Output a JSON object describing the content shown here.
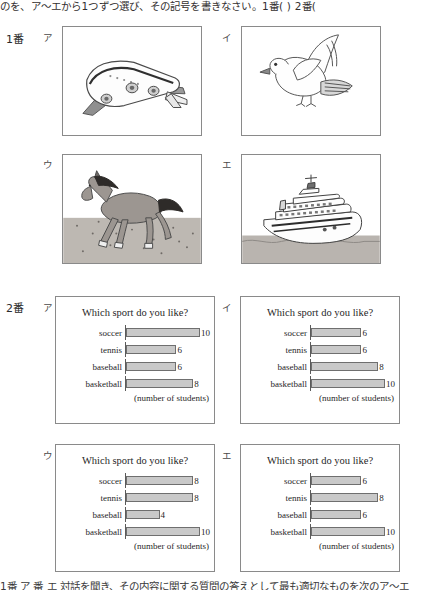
{
  "header": {
    "instruction": "のを、ア〜エから1つずつ選び、その記号を書きなさい。1番(        )  2番("
  },
  "footer": {
    "text": "1番 ア 番 エ 対話を聞き、その内容に関する質問の答えとして最も適切なものを次のア〜エ"
  },
  "question1": {
    "label": "1番",
    "choices": [
      {
        "letter": "ア",
        "picture": "airplane-illustration"
      },
      {
        "letter": "イ",
        "picture": "bird-illustration"
      },
      {
        "letter": "ウ",
        "picture": "horse-illustration"
      },
      {
        "letter": "エ",
        "picture": "ship-illustration"
      }
    ]
  },
  "question2": {
    "label": "2番",
    "choices": [
      {
        "letter": "ア",
        "chart_ref": 0
      },
      {
        "letter": "イ",
        "chart_ref": 1
      },
      {
        "letter": "ウ",
        "chart_ref": 2
      },
      {
        "letter": "エ",
        "chart_ref": 3
      }
    ]
  },
  "chart_data": [
    {
      "type": "bar",
      "orientation": "horizontal",
      "title": "Which sport do you like?",
      "categories": [
        "soccer",
        "tennis",
        "baseball",
        "basketball"
      ],
      "values": [
        10,
        6,
        6,
        8
      ],
      "xlabel": "(number of students)",
      "ylabel": "",
      "xlim": [
        0,
        10
      ],
      "grid": false,
      "legend": "none",
      "choice_letter": "ア"
    },
    {
      "type": "bar",
      "orientation": "horizontal",
      "title": "Which sport do you like?",
      "categories": [
        "soccer",
        "tennis",
        "baseball",
        "basketball"
      ],
      "values": [
        6,
        6,
        8,
        10
      ],
      "xlabel": "(number of students)",
      "ylabel": "",
      "xlim": [
        0,
        10
      ],
      "grid": false,
      "legend": "none",
      "choice_letter": "イ"
    },
    {
      "type": "bar",
      "orientation": "horizontal",
      "title": "Which sport do you like?",
      "categories": [
        "soccer",
        "tennis",
        "baseball",
        "basketball"
      ],
      "values": [
        8,
        8,
        4,
        10
      ],
      "xlabel": "(number of students)",
      "ylabel": "",
      "xlim": [
        0,
        10
      ],
      "grid": false,
      "legend": "none",
      "choice_letter": "ウ"
    },
    {
      "type": "bar",
      "orientation": "horizontal",
      "title": "Which sport do you like?",
      "categories": [
        "soccer",
        "tennis",
        "baseball",
        "basketball"
      ],
      "values": [
        6,
        8,
        6,
        10
      ],
      "xlabel": "(number of students)",
      "ylabel": "",
      "xlim": [
        0,
        10
      ],
      "grid": false,
      "legend": "none",
      "choice_letter": "エ"
    }
  ],
  "colors": {
    "bar_fill": "#c9c9c9",
    "bar_stroke": "#6f6f6f",
    "panel_border": "#8a8a8a",
    "text": "#1f1f1f"
  }
}
